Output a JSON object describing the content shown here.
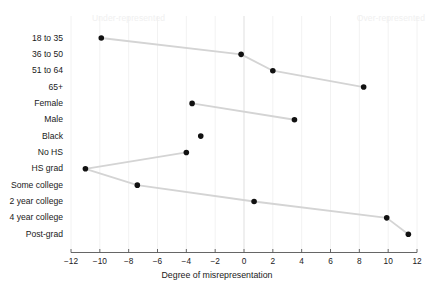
{
  "chart_data": {
    "type": "scatter",
    "title": "",
    "xlabel": "Degree of misrepresentation",
    "ylabel": "",
    "xlim": [
      -13.2,
      12.8
    ],
    "xticks": [
      -12,
      -10,
      -8,
      -6,
      -4,
      -2,
      0,
      2,
      4,
      6,
      8,
      10,
      12
    ],
    "xtick_labels": [
      "−12",
      "−10",
      "−8",
      "−6",
      "−4",
      "−2",
      "0",
      "2",
      "4",
      "6",
      "8",
      "10",
      "12"
    ],
    "grid": true,
    "zero_reference_line": 0,
    "annotations": [
      {
        "name": "under-represented",
        "text": "Under-represented",
        "side": "left"
      },
      {
        "name": "over-represented",
        "text": "Over-represented",
        "side": "right"
      }
    ],
    "categories": [
      "18 to 35",
      "36 to 50",
      "51 to 64",
      "65+",
      "Female",
      "Male",
      "Black",
      "No HS",
      "HS grad",
      "Some college",
      "2 year college",
      "4 year college",
      "Post-grad"
    ],
    "values": [
      -9.9,
      -0.2,
      2.0,
      8.3,
      -3.6,
      3.5,
      -3.0,
      -4.0,
      -11.0,
      -7.4,
      0.7,
      9.9,
      11.4
    ],
    "groups": [
      {
        "name": "age",
        "categories": [
          "18 to 35",
          "36 to 50",
          "51 to 64",
          "65+"
        ],
        "connected": true
      },
      {
        "name": "gender",
        "categories": [
          "Female",
          "Male"
        ],
        "connected": true
      },
      {
        "name": "race",
        "categories": [
          "Black"
        ],
        "connected": false
      },
      {
        "name": "education",
        "categories": [
          "No HS",
          "HS grad",
          "Some college",
          "2 year college",
          "4 year college",
          "Post-grad"
        ],
        "connected": true
      }
    ],
    "colors": {
      "point": "#111111",
      "connector": "#d4d4d4",
      "grid": "#f2f2f2",
      "axis": "#555555",
      "annotation": "#f0f0f0"
    }
  }
}
